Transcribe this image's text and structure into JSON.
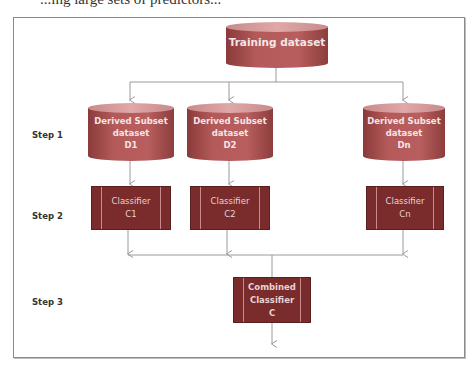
{
  "page": {
    "cut_text": "...ing large sets of predictors..."
  },
  "diagram": {
    "steps": [
      {
        "label": "Step 1"
      },
      {
        "label": "Step 2"
      },
      {
        "label": "Step 3"
      }
    ],
    "training": {
      "label": "Training dataset"
    },
    "subsets": [
      {
        "line1": "Derived Subset",
        "line2": "dataset",
        "line3": "D1"
      },
      {
        "line1": "Derived Subset",
        "line2": "dataset",
        "line3": "D2"
      },
      {
        "line1": "Derived Subset",
        "line2": "dataset",
        "line3": "Dn"
      }
    ],
    "classifiers": [
      {
        "line1": "Classifier",
        "line2": "C1"
      },
      {
        "line1": "Classifier",
        "line2": "C2"
      },
      {
        "line1": "Classifier",
        "line2": "Cn"
      }
    ],
    "combined": {
      "line1": "Combined",
      "line2": "Classifier",
      "line3": "C"
    },
    "colors": {
      "cylinder": "#b45a5a",
      "cylinder_top": "#e0a8a8",
      "classifier": "#7a2c2c",
      "connector": "#9a9a9a",
      "frame": "#8a8a8a"
    }
  }
}
